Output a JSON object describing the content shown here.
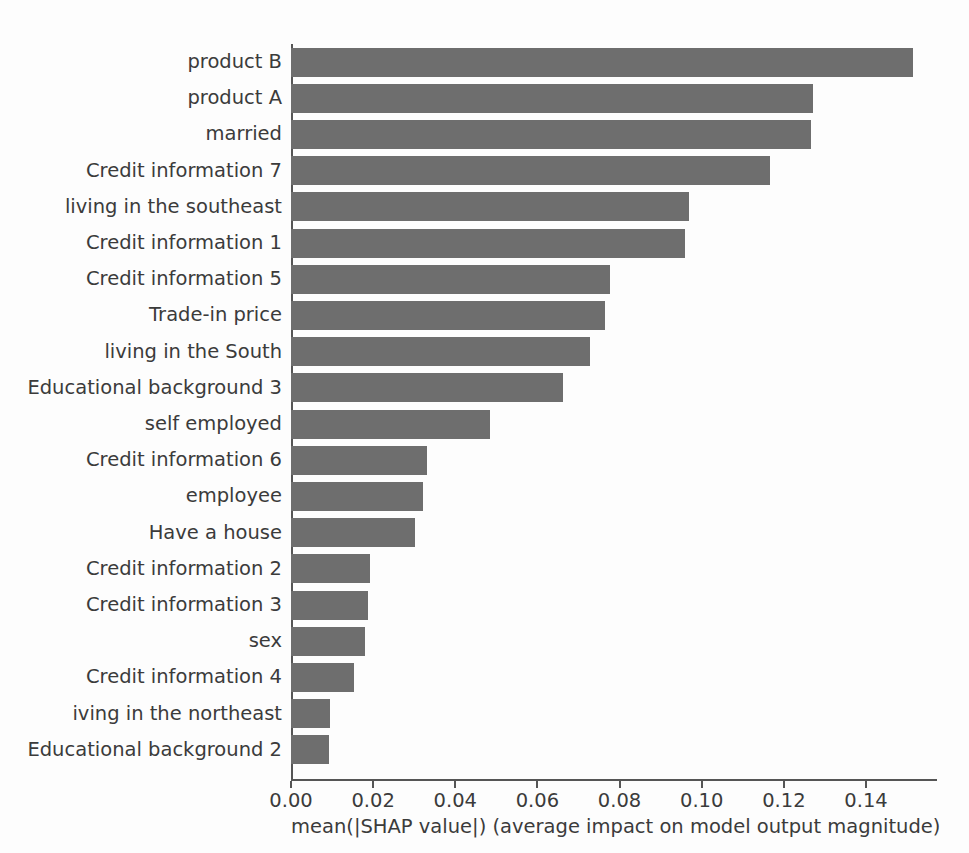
{
  "chart_data": {
    "type": "bar",
    "orientation": "horizontal",
    "title": "",
    "xlabel": "mean(|SHAP value|) (average impact on model output magnitude)",
    "ylabel": "",
    "xlim": [
      0.0,
      0.16
    ],
    "xticks": [
      0.0,
      0.02,
      0.04,
      0.06,
      0.08,
      0.1,
      0.12,
      0.14
    ],
    "xticklabels": [
      "0.00",
      "0.02",
      "0.04",
      "0.06",
      "0.08",
      "0.10",
      "0.12",
      "0.14"
    ],
    "grid": false,
    "legend": null,
    "bar_color": "#6e6e6e",
    "categories": [
      "product B",
      "product A",
      "married",
      "Credit information 7",
      "living in the southeast",
      "Credit information 1",
      "Credit information 5",
      "Trade-in price",
      "living in the South",
      "Educational background 3",
      "self employed",
      "Credit information 6",
      "employee",
      "Have a house",
      "Credit information 2",
      "Credit information 3",
      "sex",
      "Credit information 4",
      "iving in the northeast",
      "Educational background 2"
    ],
    "values": [
      0.1515,
      0.1271,
      0.1266,
      0.1167,
      0.097,
      0.0959,
      0.0777,
      0.0765,
      0.0728,
      0.0662,
      0.0484,
      0.0331,
      0.0321,
      0.0302,
      0.0192,
      0.0188,
      0.018,
      0.0153,
      0.0095,
      0.0093
    ]
  },
  "figure": {
    "caption": ""
  }
}
